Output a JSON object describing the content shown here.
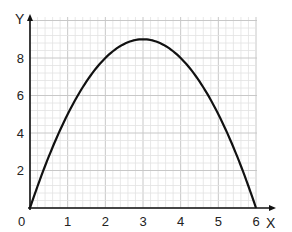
{
  "chart_data": {
    "type": "line",
    "title": "",
    "xlabel": "X",
    "ylabel": "Y",
    "xlim": [
      0,
      6
    ],
    "ylim": [
      0,
      10
    ],
    "grid": true,
    "grid_minor_step": 0.2,
    "x_ticks": [
      "0",
      "1",
      "2",
      "3",
      "4",
      "5",
      "6"
    ],
    "y_ticks": [
      "2",
      "4",
      "6",
      "8"
    ],
    "series": [
      {
        "name": "y = 9 - (x - 3)^2",
        "color": "#111111",
        "x": [
          0,
          0.5,
          1,
          1.5,
          2,
          2.5,
          3,
          3.5,
          4,
          4.5,
          5,
          5.5,
          6
        ],
        "y": [
          0,
          4.75,
          5,
          6.75,
          8,
          8.75,
          9,
          8.75,
          8,
          6.75,
          5,
          2.75,
          0
        ]
      }
    ]
  },
  "labels": {
    "origin": "0",
    "x_axis": "X",
    "y_axis": "Y"
  },
  "colors": {
    "grid_minor": "#e2e2e2",
    "grid_major": "#c8c8c8",
    "axis": "#111111",
    "curve": "#111111"
  }
}
